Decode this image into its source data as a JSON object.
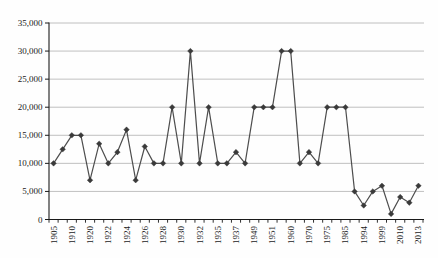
{
  "chart_data": {
    "type": "line",
    "title": "",
    "xlabel": "",
    "ylabel": "",
    "grid": true,
    "legend_position": "none",
    "marker": "diamond",
    "ylim": [
      0,
      35000
    ],
    "ytick_step": 5000,
    "ytick_labels": [
      "0",
      "5,000",
      "10,000",
      "15,000",
      "20,000",
      "25,000",
      "30,000",
      "35,000"
    ],
    "categories": [
      "1905",
      "",
      "1910",
      "",
      "1920",
      "",
      "1922",
      "",
      "1924",
      "",
      "1926",
      "",
      "1928",
      "",
      "1930",
      "",
      "1932",
      "",
      "1935",
      "",
      "1937",
      "",
      "1949",
      "",
      "1951",
      "",
      "1960",
      "",
      "1970",
      "",
      "1975",
      "",
      "1985",
      "",
      "1994",
      "",
      "1999",
      "",
      "2010",
      "",
      "2013"
    ],
    "values": [
      10000,
      12500,
      15000,
      15000,
      7000,
      13500,
      10000,
      12000,
      16000,
      7000,
      13000,
      10000,
      10000,
      20000,
      10000,
      30000,
      10000,
      20000,
      10000,
      10000,
      12000,
      10000,
      20000,
      20000,
      20000,
      30000,
      30000,
      10000,
      12000,
      10000,
      20000,
      20000,
      20000,
      5000,
      2500,
      5000,
      6000,
      1000,
      4000,
      3000,
      6000
    ],
    "colors": {
      "line": "#4d4d4d",
      "marker": "#3a3a3a",
      "gridline": "#b0b0b0",
      "axis": "#1a1a1a",
      "tick": "#1a1a1a",
      "label_text": "#1a1a1a",
      "background": "#fefefe"
    }
  }
}
